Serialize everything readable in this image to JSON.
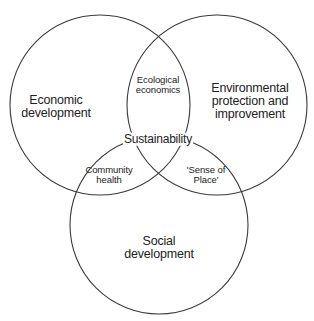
{
  "diagram": {
    "type": "venn",
    "circles": [
      {
        "id": "economic",
        "label": "Economic\ndevelopment",
        "cx": 100,
        "cy": 105,
        "r": 90
      },
      {
        "id": "environmental",
        "label": "Environmental\nprotection and\nimprovement",
        "cx": 217,
        "cy": 105,
        "r": 90
      },
      {
        "id": "social",
        "label": "Social\ndevelopment",
        "cx": 159,
        "cy": 225,
        "r": 89
      }
    ],
    "labels": {
      "economic": {
        "line1": "Economic",
        "line2": "development"
      },
      "environmental": {
        "line1": "Environmental",
        "line2": "protection and",
        "line3": "improvement"
      },
      "social": {
        "line1": "Social",
        "line2": "development"
      },
      "economic_environmental": {
        "line1": "Ecological",
        "line2": "economics"
      },
      "economic_social": {
        "line1": "Community",
        "line2": "health"
      },
      "environmental_social": {
        "line1": "'Sense of",
        "line2": "Place'"
      },
      "center": "Sustainability"
    },
    "stroke_color": "#3a3a3a",
    "text_color": "#222222",
    "background": "#ffffff"
  }
}
